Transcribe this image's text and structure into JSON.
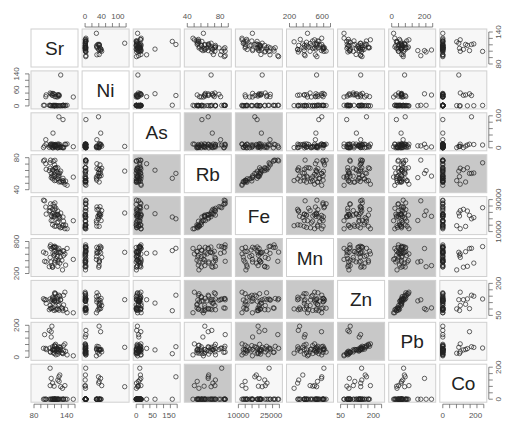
{
  "chart_data": {
    "type": "scatter",
    "title": "",
    "subtype": "scatterplot-matrix",
    "variables": [
      "Sr",
      "Ni",
      "As",
      "Rb",
      "Fe",
      "Mn",
      "Zn",
      "Pb",
      "Co"
    ],
    "shaded_color": "#c8c8c8",
    "unshaded_color": "#f7f7f7",
    "diag_color": "#ffffff",
    "point_color": "#222222",
    "shaded_panels": [
      [
        2,
        3
      ],
      [
        2,
        4
      ],
      [
        3,
        2
      ],
      [
        3,
        4
      ],
      [
        3,
        5
      ],
      [
        3,
        6
      ],
      [
        3,
        8
      ],
      [
        4,
        2
      ],
      [
        4,
        3
      ],
      [
        4,
        5
      ],
      [
        4,
        6
      ],
      [
        4,
        7
      ],
      [
        5,
        3
      ],
      [
        5,
        4
      ],
      [
        5,
        6
      ],
      [
        5,
        7
      ],
      [
        6,
        3
      ],
      [
        6,
        4
      ],
      [
        6,
        5
      ],
      [
        6,
        7
      ],
      [
        7,
        4
      ],
      [
        7,
        5
      ],
      [
        7,
        6
      ],
      [
        8,
        3
      ]
    ],
    "axes": {
      "top": [
        {
          "col": 1,
          "ticks": [
            "0",
            "40",
            "100"
          ]
        },
        {
          "col": 3,
          "ticks": [
            "40",
            "80"
          ]
        },
        {
          "col": 5,
          "ticks": [
            "200",
            "600"
          ]
        },
        {
          "col": 7,
          "ticks": [
            "0",
            "200"
          ]
        }
      ],
      "bottom": [
        {
          "col": 0,
          "ticks": [
            "80",
            "140"
          ]
        },
        {
          "col": 2,
          "ticks": [
            "0",
            "50",
            "150"
          ]
        },
        {
          "col": 4,
          "ticks": [
            "10000",
            "25000"
          ]
        },
        {
          "col": 6,
          "ticks": [
            "50",
            "200"
          ]
        },
        {
          "col": 8,
          "ticks": [
            "0",
            "200"
          ]
        }
      ],
      "left": [
        {
          "row": 1,
          "ticks": [
            "0",
            "60",
            "140"
          ]
        },
        {
          "row": 3,
          "ticks": [
            "40",
            "80"
          ]
        },
        {
          "row": 5,
          "ticks": [
            "200",
            "800"
          ]
        },
        {
          "row": 7,
          "ticks": [
            "0",
            "200"
          ]
        }
      ],
      "right": [
        {
          "row": 0,
          "ticks": [
            "80",
            "140"
          ]
        },
        {
          "row": 2,
          "ticks": [
            "0",
            "100"
          ]
        },
        {
          "row": 4,
          "ticks": [
            "10000",
            "30000"
          ]
        },
        {
          "row": 6,
          "ticks": [
            "50",
            "200"
          ]
        },
        {
          "row": 8,
          "ticks": [
            "0",
            "200"
          ]
        }
      ]
    },
    "ranges": {
      "Sr": [
        70,
        190
      ],
      "Ni": [
        0,
        145
      ],
      "As": [
        0,
        160
      ],
      "Rb": [
        20,
        100
      ],
      "Fe": [
        5000,
        35000
      ],
      "Mn": [
        100,
        850
      ],
      "Zn": [
        20,
        280
      ],
      "Pb": [
        0,
        350
      ],
      "Co": [
        0,
        330
      ]
    },
    "legend": null,
    "grid": false
  }
}
